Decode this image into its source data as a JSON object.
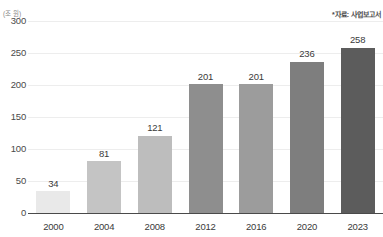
{
  "chart_data": {
    "type": "bar",
    "title": "",
    "subtitle": "",
    "unit_label": "(조 원)",
    "source_note": "*자료: 사업보고서",
    "categories": [
      "2000",
      "2004",
      "2008",
      "2012",
      "2016",
      "2020",
      "2023"
    ],
    "values": [
      34,
      81,
      121,
      201,
      201,
      236,
      258
    ],
    "bar_colors": [
      "#e9e9e9",
      "#c4c4c4",
      "#bdbdbd",
      "#8e8e8e",
      "#9c9c9c",
      "#7e7e7e",
      "#5c5c5c"
    ],
    "xlabel": "",
    "ylabel": "",
    "ylim": [
      0,
      300
    ],
    "yticks": [
      0,
      50,
      100,
      150,
      200,
      250,
      300
    ],
    "ytick_labels": [
      "0",
      "50",
      "100",
      "150",
      "200",
      "250",
      "300"
    ],
    "grid": true,
    "grid_axis": "y",
    "legend": false,
    "legend_position": "none",
    "data_labels": true,
    "background": "#ffffff",
    "axis_color": "#4a4a4a",
    "grid_color": "#ededed"
  }
}
